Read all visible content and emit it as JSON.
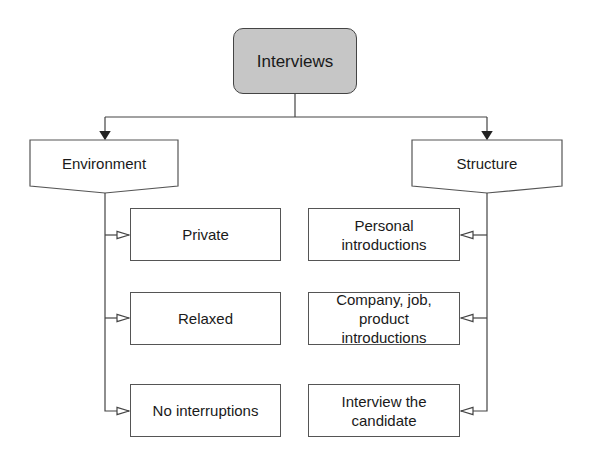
{
  "diagram": {
    "root": {
      "label": "Interviews",
      "fill": "#c6c6c6"
    },
    "branches": [
      {
        "label": "Environment",
        "children": [
          {
            "label": "Private"
          },
          {
            "label": "Relaxed"
          },
          {
            "label": "No interruptions"
          }
        ]
      },
      {
        "label": "Structure",
        "children": [
          {
            "label": "Personal\nintroductions"
          },
          {
            "label": "Company, job,\nproduct\nintroductions"
          },
          {
            "label": "Interview the\ncandidate"
          }
        ]
      }
    ]
  }
}
